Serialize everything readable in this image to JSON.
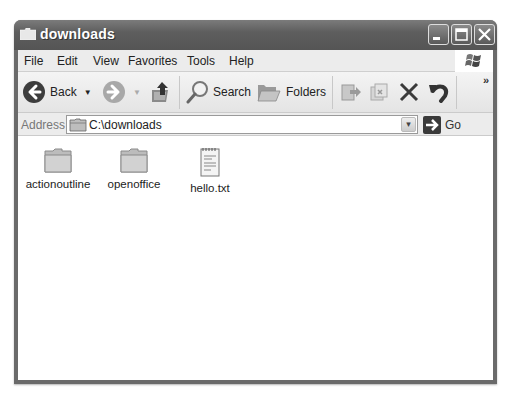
{
  "window": {
    "title": "downloads",
    "controls": {
      "minimize": "minimize",
      "maximize": "maximize",
      "close": "close"
    }
  },
  "menubar": {
    "items": [
      {
        "label": "File",
        "accel": "F"
      },
      {
        "label": "Edit",
        "accel": "E"
      },
      {
        "label": "View",
        "accel": "V"
      },
      {
        "label": "Favorites",
        "accel": "a"
      },
      {
        "label": "Tools",
        "accel": "T"
      },
      {
        "label": "Help",
        "accel": "H"
      }
    ]
  },
  "toolbar": {
    "back_label": "Back",
    "search_label": "Search",
    "folders_label": "Folders",
    "overflow": "»",
    "icons": [
      "back-icon",
      "forward-icon",
      "up-folder-icon",
      "search-icon",
      "folders-icon",
      "move-to-icon",
      "copy-to-icon",
      "delete-icon",
      "undo-icon"
    ]
  },
  "addressbar": {
    "label": "Address",
    "value": "C:\\downloads",
    "go_label": "Go"
  },
  "content": {
    "items": [
      {
        "name": "actionoutline",
        "type": "folder"
      },
      {
        "name": "openoffice",
        "type": "folder"
      },
      {
        "name": "hello.txt",
        "type": "text-file"
      }
    ]
  }
}
